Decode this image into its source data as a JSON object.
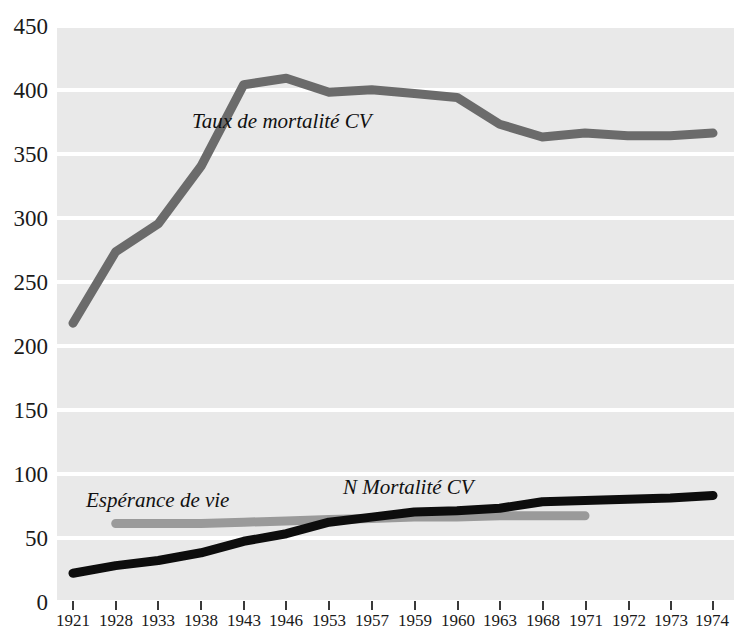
{
  "chart_data": {
    "type": "line",
    "title": "",
    "xlabel": "",
    "ylabel": "",
    "categories": [
      "1921",
      "1928",
      "1933",
      "1938",
      "1943",
      "1946",
      "1953",
      "1957",
      "1959",
      "1960",
      "1963",
      "1968",
      "1971",
      "1972",
      "1973",
      "1974"
    ],
    "ylim": [
      0,
      450
    ],
    "ytick_labels": [
      "0",
      "50",
      "100",
      "150",
      "200",
      "250",
      "300",
      "350",
      "400",
      "450"
    ],
    "ytick_values": [
      0,
      50,
      100,
      150,
      200,
      250,
      300,
      350,
      400,
      450
    ],
    "grid": "horizontal",
    "legend_position": "inline-annotations",
    "series": [
      {
        "name": "Taux de mortalité CV",
        "color": "#6b6b6b",
        "values": [
          217,
          273,
          295,
          340,
          404,
          409,
          398,
          400,
          397,
          394,
          373,
          363,
          366,
          364,
          364,
          366
        ]
      },
      {
        "name": "N Mortalité CV",
        "color": "#0d0d0d",
        "values": [
          21,
          27,
          31,
          37,
          46,
          52,
          61,
          65,
          69,
          70,
          72,
          77,
          78,
          79,
          80,
          82
        ]
      },
      {
        "name": "Espérance de vie",
        "color": "#9a9a9a",
        "values": [
          null,
          60,
          60,
          60,
          61,
          62,
          63,
          64,
          65,
          65,
          66,
          66,
          66,
          null,
          null,
          null
        ]
      }
    ],
    "annotations": [
      {
        "text": "Taux de mortalité CV",
        "series": "Taux de mortalité CV"
      },
      {
        "text": "N Mortalité CV",
        "series": "N Mortalité CV"
      },
      {
        "text": "Espérance de vie",
        "series": "Espérance de vie"
      }
    ]
  },
  "axes": {
    "y": {
      "t450": "450",
      "t400": "400",
      "t350": "350",
      "t300": "300",
      "t250": "250",
      "t200": "200",
      "t150": "150",
      "t100": "100",
      "t50": "50",
      "t0": "0"
    },
    "x": {
      "t0": "1921",
      "t1": "1928",
      "t2": "1933",
      "t3": "1938",
      "t4": "1943",
      "t5": "1946",
      "t6": "1953",
      "t7": "1957",
      "t8": "1959",
      "t9": "1960",
      "t10": "1963",
      "t11": "1968",
      "t12": "1971",
      "t13": "1972",
      "t14": "1973",
      "t15": "1974"
    }
  },
  "labels": {
    "mortality_rate": "Taux de mortalité CV",
    "n_mortality": "N Mortalité CV",
    "life_expectancy": "Espérance de vie"
  },
  "colors": {
    "plot_background": "#e9e9e9",
    "gridline": "#ffffff",
    "mortality_rate_line": "#6b6b6b",
    "n_mortality_line": "#0d0d0d",
    "life_expectancy_line": "#9a9a9a",
    "text": "#1a1a1a"
  }
}
